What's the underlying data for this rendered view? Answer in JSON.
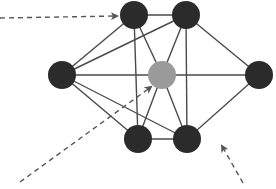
{
  "diagram": {
    "type": "network-graph",
    "colors": {
      "node_dark": "#2b2b2b",
      "node_center": "#9a9a9a",
      "edge": "#4a4a4a",
      "arrow": "#555555",
      "background": "#ffffff"
    },
    "node_radius": 14,
    "nodes": [
      {
        "id": "A",
        "x": 134,
        "y": 15,
        "role": "dark"
      },
      {
        "id": "B",
        "x": 186,
        "y": 15,
        "role": "dark"
      },
      {
        "id": "C",
        "x": 62,
        "y": 75,
        "role": "dark"
      },
      {
        "id": "D",
        "x": 162,
        "y": 75,
        "role": "center"
      },
      {
        "id": "E",
        "x": 259,
        "y": 75,
        "role": "dark"
      },
      {
        "id": "F",
        "x": 138,
        "y": 139,
        "role": "dark"
      },
      {
        "id": "G",
        "x": 187,
        "y": 139,
        "role": "dark"
      }
    ],
    "edges": [
      [
        "A",
        "B"
      ],
      [
        "A",
        "C"
      ],
      [
        "A",
        "D"
      ],
      [
        "A",
        "F"
      ],
      [
        "B",
        "C"
      ],
      [
        "B",
        "D"
      ],
      [
        "B",
        "E"
      ],
      [
        "B",
        "G"
      ],
      [
        "C",
        "D"
      ],
      [
        "C",
        "F"
      ],
      [
        "C",
        "G"
      ],
      [
        "D",
        "E"
      ],
      [
        "D",
        "F"
      ],
      [
        "D",
        "G"
      ],
      [
        "E",
        "G"
      ],
      [
        "F",
        "G"
      ]
    ],
    "arrows": [
      {
        "name": "arrow-to-top-left-node",
        "x1": 0,
        "y1": 18,
        "x2": 117,
        "y2": 16
      },
      {
        "name": "arrow-to-center-node",
        "x1": 20,
        "y1": 182,
        "x2": 151,
        "y2": 87
      },
      {
        "name": "arrow-to-edge-e-g",
        "x1": 243,
        "y1": 183,
        "x2": 222,
        "y2": 146
      }
    ]
  }
}
